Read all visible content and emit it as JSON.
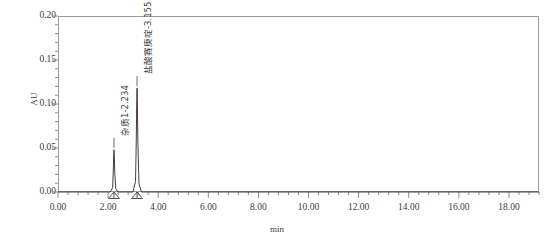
{
  "chart_data": {
    "type": "line",
    "title": "",
    "xlabel": "min",
    "ylabel": "AU",
    "xlim": [
      0.0,
      19.2
    ],
    "ylim": [
      0.0,
      0.2
    ],
    "grid": false,
    "legend": "none",
    "x_ticks": [
      "0.00",
      "2.00",
      "4.00",
      "6.00",
      "8.00",
      "10.00",
      "12.00",
      "14.00",
      "16.00",
      "18.00"
    ],
    "x_tick_values": [
      0.0,
      2.0,
      4.0,
      6.0,
      8.0,
      10.0,
      12.0,
      14.0,
      16.0,
      18.0
    ],
    "y_ticks": [
      "0.20",
      "0.15",
      "0.10",
      "0.05",
      "0.00"
    ],
    "y_tick_values": [
      0.2,
      0.15,
      0.1,
      0.05,
      0.0
    ],
    "x_minor_interval": 0.4,
    "y_minor_interval": 0.01,
    "baseline": 0.0,
    "series": [
      {
        "name": "UV trace",
        "color": "#2b2b2b",
        "peaks": [
          {
            "label": "杂质1-2.234",
            "compound": "杂质1",
            "retention_time": 2.234,
            "height": 0.048,
            "width": 0.1
          },
          {
            "label": "盐酸赛庚啶-3.155",
            "compound": "盐酸赛庚啶",
            "retention_time": 3.155,
            "height": 0.118,
            "width": 0.11
          }
        ]
      }
    ],
    "integration_markers": [
      {
        "retention_time": 2.234,
        "shape": "triangle"
      },
      {
        "retention_time": 3.155,
        "shape": "triangle"
      }
    ]
  },
  "axes": {
    "y_title": "AU",
    "x_title": "min"
  },
  "colors": {
    "trace": "#2b2b2b",
    "frame": "#9a9a9a",
    "tick": "#6e6e6e",
    "text": "#3c3c3c"
  }
}
